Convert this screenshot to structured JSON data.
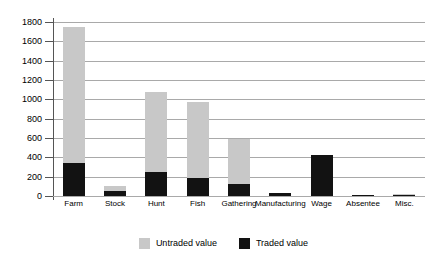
{
  "chart_data": {
    "type": "bar",
    "subtype": "stacked",
    "title": "",
    "xlabel": "",
    "ylabel": "",
    "ylim": [
      0,
      1800
    ],
    "ytick_step": 200,
    "yticks": [
      1800,
      1600,
      1400,
      1200,
      1000,
      800,
      600,
      400,
      200,
      0
    ],
    "ytick_labels": [
      "1800",
      "1600",
      "1400",
      "1200",
      "1000",
      "800",
      "600",
      "400",
      "200",
      "0"
    ],
    "grid": true,
    "grid_axis": "y",
    "legend_position": "bottom-center",
    "categories": [
      "Farm",
      "Stock",
      "Hunt",
      "Fish",
      "Gathering",
      "Manufacturing",
      "Wage",
      "Absentee",
      "Misc."
    ],
    "series": [
      {
        "name": "Untraded value",
        "color": "#c8c8c8",
        "values": [
          1410,
          50,
          835,
          785,
          470,
          0,
          0,
          0,
          10
        ]
      },
      {
        "name": "Traded value",
        "color": "#121212",
        "values": [
          340,
          50,
          245,
          190,
          120,
          30,
          425,
          15,
          15
        ]
      }
    ],
    "totals": [
      1750,
      100,
      1080,
      975,
      590,
      30,
      425,
      15,
      25
    ]
  },
  "legend": {
    "items": [
      {
        "label": "Untraded value",
        "swatch": "legend-swatch-untraded"
      },
      {
        "label": "Traded value",
        "swatch": "legend-swatch-traded"
      }
    ]
  },
  "colors": {
    "untraded": "#c8c8c8",
    "traded": "#121212",
    "gridline": "#a9a9a9",
    "axis": "#555555",
    "background": "#ffffff",
    "text": "#000000"
  }
}
